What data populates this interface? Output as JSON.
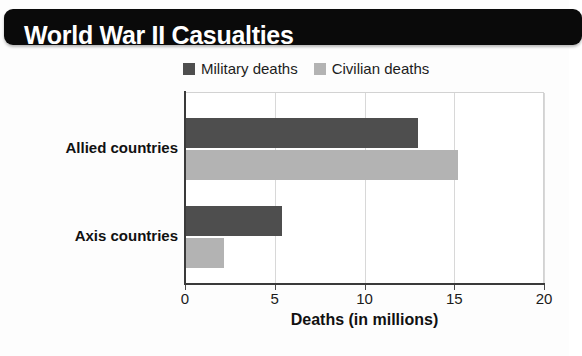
{
  "banner": {
    "title": "World War II Casualties"
  },
  "source_note": {
    "text": ""
  },
  "chart_data": {
    "type": "bar",
    "orientation": "horizontal",
    "title": "World War II Casualties",
    "xlabel": "Deaths (in millions)",
    "ylabel": "",
    "categories": [
      "Allied countries",
      "Axis countries"
    ],
    "series": [
      {
        "name": "Military deaths",
        "color": "#4e4e4e",
        "values": [
          13.0,
          5.4
        ]
      },
      {
        "name": "Civilian deaths",
        "color": "#b3b3b3",
        "values": [
          15.2,
          2.2
        ]
      }
    ],
    "xlim": [
      0,
      20
    ],
    "xticks": [
      "0",
      "5",
      "10",
      "15",
      "20"
    ],
    "xtick_values": [
      0,
      5,
      10,
      15,
      20
    ],
    "grid": true,
    "legend_position": "top-center"
  }
}
